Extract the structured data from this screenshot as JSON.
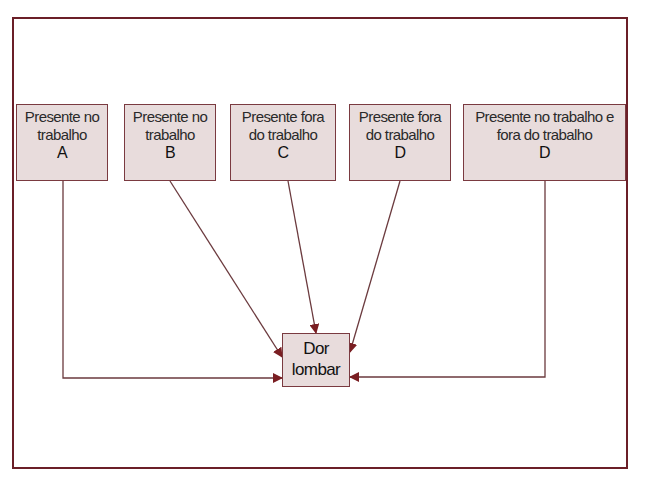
{
  "diagram": {
    "sources": [
      {
        "id": "A",
        "line1": "Presente no",
        "line2": "trabalho",
        "letter": "A"
      },
      {
        "id": "B",
        "line1": "Presente no",
        "line2": "trabalho",
        "letter": "B"
      },
      {
        "id": "C",
        "line1": "Presente fora",
        "line2": "do trabalho",
        "letter": "C"
      },
      {
        "id": "D1",
        "line1": "Presente fora",
        "line2": "do trabalho",
        "letter": "D"
      },
      {
        "id": "D2",
        "line1": "Presente no trabalho e",
        "line2": "fora do trabalho",
        "letter": "D"
      }
    ],
    "target": {
      "line1": "Dor",
      "line2": "lombar"
    },
    "colors": {
      "frame": "#6b1f28",
      "box_fill": "#e8dcdc",
      "box_border": "#7a3a40",
      "arrow": "#7a1e22"
    }
  }
}
